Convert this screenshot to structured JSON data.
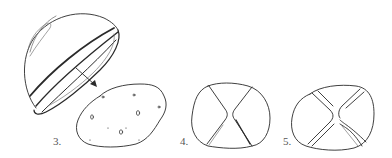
{
  "figure": {
    "steps": [
      {
        "id": "3",
        "label": "3.",
        "subject": "cut half-dome shell with band, arrow pointing to flattened blob shape with small holes"
      },
      {
        "id": "4",
        "label": "4.",
        "subject": "rounded square outline with two inward-curving creases"
      },
      {
        "id": "5",
        "label": "5.",
        "subject": "rounded square outline with X-shaped double crease lines"
      }
    ]
  },
  "colors": {
    "ink": "#2a2a2a",
    "ink_light": "#7a7a7a",
    "label": "#555555",
    "background": "#ffffff"
  }
}
